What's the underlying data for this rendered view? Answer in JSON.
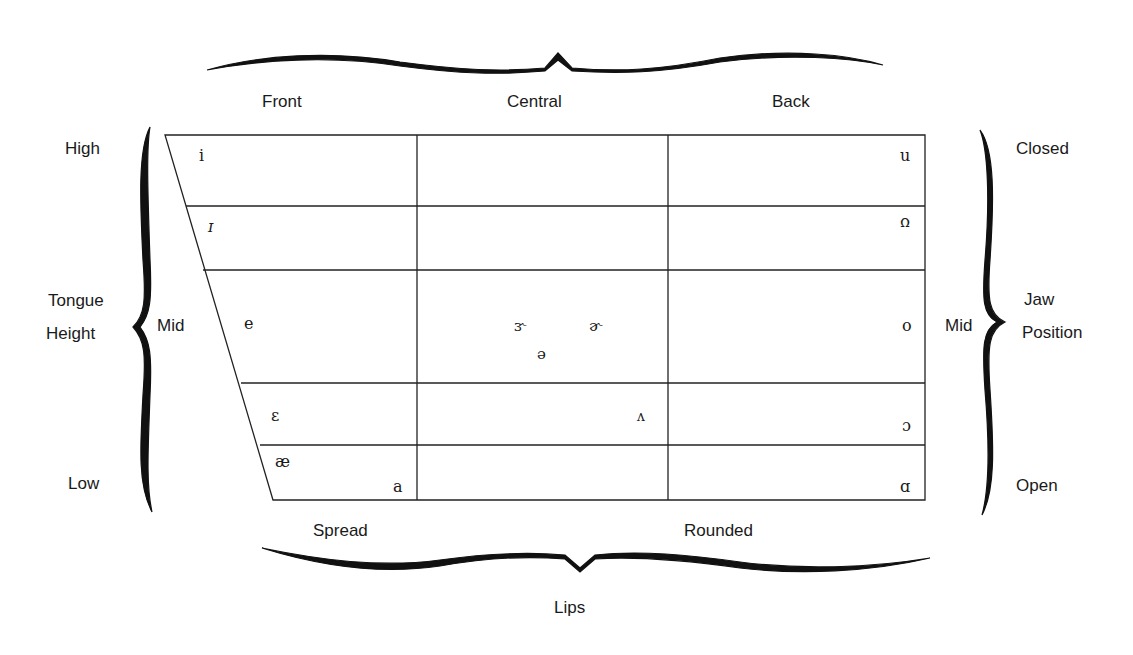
{
  "diagram": {
    "type": "vowel-quadrilateral",
    "top_axis": {
      "labels": [
        "Front",
        "Central",
        "Back"
      ]
    },
    "bottom_axis": {
      "labels": [
        "Spread",
        "Rounded"
      ],
      "title": "Lips"
    },
    "left_axis": {
      "high": "High",
      "title_line1": "Tongue",
      "title_line2": "Height",
      "mid": "Mid",
      "low": "Low"
    },
    "right_axis": {
      "closed": "Closed",
      "title_line1": "Jaw",
      "title_line2": "Position",
      "mid": "Mid",
      "open": "Open"
    },
    "vowels": {
      "front": [
        "i",
        "ɪ",
        "e",
        "ɛ",
        "æ",
        "a"
      ],
      "central": [
        "ɝ",
        "ɚ",
        "ə",
        "ʌ"
      ],
      "back": [
        "u",
        "ʊ",
        "o",
        "ɔ",
        "ɑ"
      ]
    }
  }
}
